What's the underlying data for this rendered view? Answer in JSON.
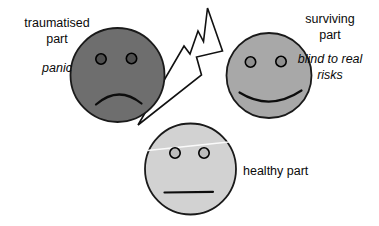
{
  "figure": {
    "background": "#ffffff",
    "parts": [
      {
        "id": "traumatised",
        "label": "traumatised part",
        "annotation": "panic",
        "mood": "sad",
        "face_fill": "#6e6e6e",
        "eye_fill": "#4f4f4f"
      },
      {
        "id": "surviving",
        "label": "surviving part",
        "annotation": "blind to real risks",
        "mood": "happy",
        "face_fill": "#a8a8a8",
        "eye_fill": "#8f8f8f"
      },
      {
        "id": "healthy",
        "label": "healthy part",
        "annotation": "",
        "mood": "neutral",
        "face_fill": "#d2d2d2",
        "eye_fill": "#bdbdbd"
      }
    ],
    "connector": {
      "id": "lightning-bolt",
      "fill": "#ffffff",
      "stroke": "#000000"
    }
  }
}
